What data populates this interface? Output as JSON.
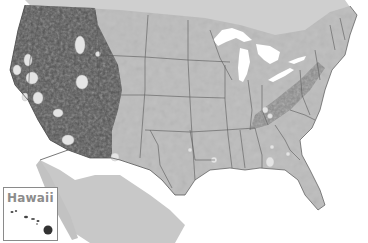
{
  "map": {
    "subject": "Contiguous United States shaded relief / range map (grayscale)",
    "colors": {
      "background": "#ffffff",
      "land_base": "#b9b9b9",
      "land_east": "#c4c4c4",
      "west_dark": "#4a4a4a",
      "state_border": "#555555",
      "water_lakes": "#ffffff",
      "mexico": "#c8c8c8",
      "canada": "#cfcfcf"
    },
    "inset": {
      "label": "Hawaii"
    }
  }
}
